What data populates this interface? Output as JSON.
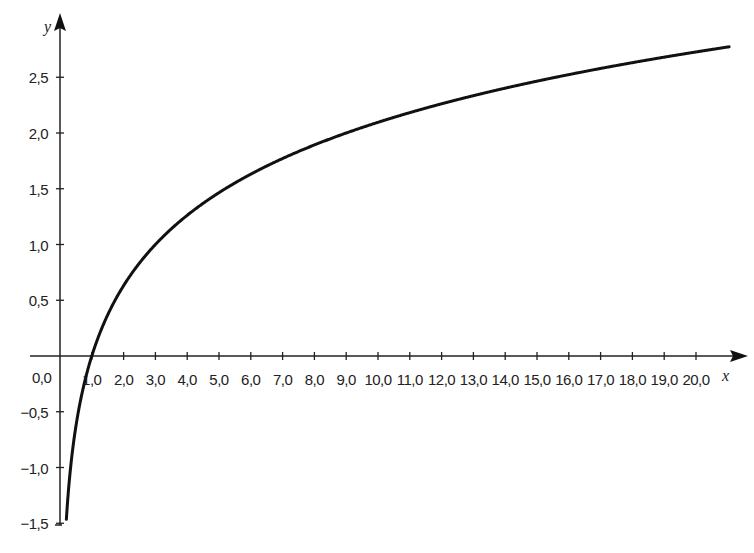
{
  "chart_data": {
    "type": "line",
    "title": "",
    "xlabel": "x",
    "ylabel": "y",
    "function": "y = log3(x)",
    "xlim": [
      0.0,
      21.0
    ],
    "ylim": [
      -1.5,
      2.9
    ],
    "grid": false,
    "legend": null,
    "x_ticks": [
      1.0,
      2.0,
      3.0,
      4.0,
      5.0,
      6.0,
      7.0,
      8.0,
      9.0,
      10.0,
      11.0,
      12.0,
      13.0,
      14.0,
      15.0,
      16.0,
      17.0,
      18.0,
      19.0,
      20.0
    ],
    "x_tick_labels": [
      "1,0",
      "2,0",
      "3,0",
      "4,0",
      "5,0",
      "6,0",
      "7,0",
      "8,0",
      "9,0",
      "10,0",
      "11,0",
      "12,0",
      "13,0",
      "14,0",
      "15,0",
      "16,0",
      "17,0",
      "18,0",
      "19,0",
      "20,0"
    ],
    "y_ticks": [
      2.5,
      2.0,
      1.5,
      1.0,
      0.5,
      -0.5,
      -1.0,
      -1.5
    ],
    "y_tick_labels": [
      "2,5",
      "2,0",
      "1,5",
      "1,0",
      "0,5",
      "-0,5",
      "-1,0",
      "-1,5"
    ],
    "origin_label": "0,0",
    "series": [
      {
        "name": "y = log3(x)",
        "x": [
          0.2,
          0.3,
          0.5,
          0.75,
          1.0,
          1.5,
          2.0,
          3.0,
          4.0,
          5.0,
          6.0,
          7.0,
          8.0,
          9.0,
          10.0,
          12.0,
          14.0,
          16.0,
          18.0,
          20.0,
          21.0
        ],
        "values": [
          -1.46,
          -1.1,
          -0.63,
          -0.26,
          0.0,
          0.37,
          0.63,
          1.0,
          1.26,
          1.46,
          1.63,
          1.77,
          1.89,
          2.0,
          2.1,
          2.26,
          2.4,
          2.52,
          2.63,
          2.73,
          2.77
        ]
      }
    ]
  },
  "layout": {
    "origin_px": [
      60,
      356
    ],
    "px_per_x": 31.8,
    "px_per_y": 111.5,
    "line_color": "#111111"
  }
}
